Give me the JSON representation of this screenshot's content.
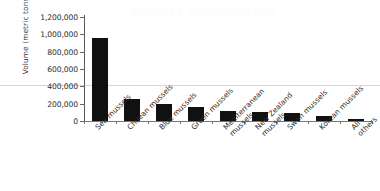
{
  "watermark": {
    "text": "MUSSEL  PRODUCTION"
  },
  "chart_data": {
    "type": "bar",
    "title": "",
    "subtitle": "",
    "xlabel": "",
    "ylabel": "Volume (metric tons)",
    "ylim": [
      0,
      1200000
    ],
    "ytick_values": [
      0,
      200000,
      400000,
      600000,
      800000,
      1000000,
      1200000
    ],
    "ytick_labels": [
      "0",
      "200,000",
      "400,000",
      "600,000",
      "800,000",
      "1,000,000",
      "1,200,000"
    ],
    "grid": false,
    "legend": false,
    "bar_color": "#111111",
    "categories": [
      "Sea mussels",
      "Chilean mussels",
      "Blue mussels",
      "Green mussels",
      "Mediterranean mussels",
      "New Zealand mussels",
      "Swan mussels",
      "Korean mussels",
      "All others"
    ],
    "category_labels_wrapped": [
      "Sea mussels",
      "Chilean mussels",
      "Blue mussels",
      "Green mussels",
      "Mediterranean\nmussels",
      "New Zealand\nmussels",
      "Swan mussels",
      "Korean mussels",
      "All others"
    ],
    "values": [
      960000,
      250000,
      200000,
      165000,
      120000,
      105000,
      90000,
      60000,
      25000
    ],
    "series": [
      {
        "name": "Volume",
        "values": [
          960000,
          250000,
          200000,
          165000,
          120000,
          105000,
          90000,
          60000,
          25000
        ]
      }
    ]
  }
}
